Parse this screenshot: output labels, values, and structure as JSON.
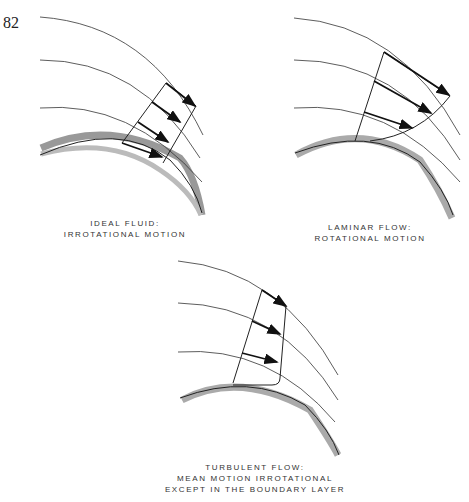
{
  "page_number": "82",
  "panels": [
    {
      "id": "ideal",
      "caption_line1": "IDEAL FLUID:",
      "caption_line2": "IRROTATIONAL MOTION"
    },
    {
      "id": "laminar",
      "caption_line1": "LAMINAR FLOW:",
      "caption_line2": "ROTATIONAL MOTION"
    },
    {
      "id": "turbulent",
      "caption_line1": "TURBULENT FLOW:",
      "caption_line2": "MEAN MOTION IRROTATIONAL",
      "caption_line3": "EXCEPT IN THE BOUNDARY LAYER"
    }
  ],
  "colors": {
    "wall": "#a8a8a8",
    "line": "#222222"
  }
}
